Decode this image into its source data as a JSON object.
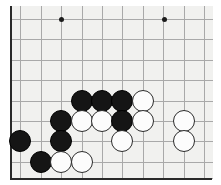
{
  "board": {
    "kind": "go-board-diagram",
    "title": "Go board position",
    "colors": {
      "surface": "#f1f1ef",
      "grid_line": "#a9a9a9",
      "border_line": "#2a2a2a",
      "black_stone": "#151515",
      "white_stone": "#fcfcfc",
      "page_background": "#ffffff"
    },
    "geometry": {
      "origin_x": 10,
      "origin_y": 19,
      "cell": 20.4,
      "columns": 10,
      "rows": 8,
      "stone_diameter": 22,
      "surface_left": 10,
      "surface_top": 6,
      "surface_width": 203,
      "surface_height": 172
    },
    "vertical_lines_x": [
      10,
      20.4,
      40.8,
      61.2,
      81.6,
      102,
      122.4,
      142.8,
      163.2,
      183.6,
      204
    ],
    "horizontal_lines_y": [
      19,
      39.4,
      59.8,
      80.2,
      100.6,
      121,
      141.4,
      161.8,
      178
    ],
    "edges": {
      "left_x": 10,
      "bottom_y": 178,
      "right_x": 212,
      "top_y": 6
    },
    "star_points": [
      {
        "name": "hoshi-left",
        "x": 61.5,
        "y": 19
      },
      {
        "name": "hoshi-right",
        "x": 164.5,
        "y": 19
      }
    ],
    "stones": [
      {
        "color": "black",
        "x": 81.6,
        "y": 100.6
      },
      {
        "color": "black",
        "x": 102.0,
        "y": 100.6
      },
      {
        "color": "black",
        "x": 122.4,
        "y": 100.6
      },
      {
        "color": "white",
        "x": 142.8,
        "y": 100.6
      },
      {
        "color": "black",
        "x": 61.2,
        "y": 121.0
      },
      {
        "color": "white",
        "x": 81.6,
        "y": 121.0
      },
      {
        "color": "white",
        "x": 102.0,
        "y": 121.0
      },
      {
        "color": "black",
        "x": 122.4,
        "y": 121.0
      },
      {
        "color": "white",
        "x": 142.8,
        "y": 121.0
      },
      {
        "color": "white",
        "x": 183.6,
        "y": 121.0
      },
      {
        "color": "black",
        "x": 20.4,
        "y": 141.4
      },
      {
        "color": "black",
        "x": 61.2,
        "y": 141.4
      },
      {
        "color": "white",
        "x": 122.4,
        "y": 141.4
      },
      {
        "color": "white",
        "x": 183.6,
        "y": 141.4
      },
      {
        "color": "black",
        "x": 40.8,
        "y": 161.8
      },
      {
        "color": "white",
        "x": 61.2,
        "y": 161.8
      },
      {
        "color": "white",
        "x": 81.6,
        "y": 161.8
      }
    ],
    "stone_count": {
      "black": 8,
      "white": 9,
      "total": 17
    }
  }
}
